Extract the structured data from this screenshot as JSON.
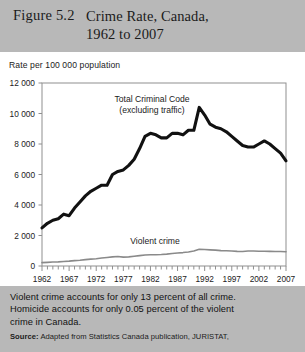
{
  "header": {
    "figure_number": "Figure 5.2",
    "title_line1": "Crime Rate, Canada,",
    "title_line2": "1962 to 2007"
  },
  "footer": {
    "note_line1": "Violent crime accounts for only 13 percent of all crime.",
    "note_line2": "Homicide accounts for only 0.05 percent of the violent",
    "note_line3": "crime in Canada.",
    "source_label": "Source:",
    "source_text": "Adapted from Statistics Canada publication, JURISTAT,"
  },
  "colors": {
    "header_band": "#b8b8b8",
    "footer_band": "#b8b8b8",
    "total_crime_line": "#111111",
    "violent_crime_line": "#8a8a8a",
    "axis": "#8f8f8f",
    "text": "#1b1b1b"
  },
  "chart_data": {
    "type": "line",
    "title": "Crime Rate, Canada, 1962 to 2007",
    "xlabel": "",
    "ylabel": "Rate per 100 000 population",
    "ylim": [
      0,
      12000
    ],
    "xlim": [
      1962,
      2007
    ],
    "grid": false,
    "legend_position": "inline-annotation",
    "ytick_labels": [
      "0",
      "2 000",
      "4 000",
      "6 000",
      "8 000",
      "10 000",
      "12 000"
    ],
    "ytick_values": [
      0,
      2000,
      4000,
      6000,
      8000,
      10000,
      12000
    ],
    "xtick_labels": [
      "1962",
      "1967",
      "1972",
      "1977",
      "1982",
      "1987",
      "1992",
      "1997",
      "2002",
      "2007"
    ],
    "xtick_values": [
      1962,
      1967,
      1972,
      1977,
      1982,
      1987,
      1992,
      1997,
      2002,
      2007
    ],
    "x": [
      1962,
      1963,
      1964,
      1965,
      1966,
      1967,
      1968,
      1969,
      1970,
      1971,
      1972,
      1973,
      1974,
      1975,
      1976,
      1977,
      1978,
      1979,
      1980,
      1981,
      1982,
      1983,
      1984,
      1985,
      1986,
      1987,
      1988,
      1989,
      1990,
      1991,
      1992,
      1993,
      1994,
      1995,
      1996,
      1997,
      1998,
      1999,
      2000,
      2001,
      2002,
      2003,
      2004,
      2005,
      2006,
      2007
    ],
    "series": [
      {
        "name": "Total Criminal Code (excluding traffic)",
        "annotation_line1": "Total Criminal Code",
        "annotation_line2": "(excluding traffic)",
        "color": "#111111",
        "values": [
          2500,
          2800,
          3000,
          3100,
          3400,
          3300,
          3800,
          4200,
          4600,
          4900,
          5100,
          5300,
          5300,
          6000,
          6200,
          6300,
          6600,
          7000,
          7700,
          8500,
          8700,
          8600,
          8400,
          8400,
          8700,
          8700,
          8600,
          8900,
          8900,
          10400,
          9900,
          9300,
          9100,
          9000,
          8800,
          8500,
          8200,
          7900,
          7800,
          7800,
          8000,
          8200,
          8000,
          7700,
          7400,
          6900
        ]
      },
      {
        "name": "Violent crime",
        "annotation_line1": "Violent crime",
        "color": "#8a8a8a",
        "values": [
          220,
          240,
          260,
          270,
          300,
          320,
          350,
          380,
          420,
          450,
          480,
          520,
          560,
          600,
          620,
          580,
          600,
          640,
          680,
          720,
          740,
          740,
          750,
          780,
          820,
          850,
          880,
          920,
          980,
          1100,
          1080,
          1060,
          1040,
          1010,
          1000,
          980,
          960,
          950,
          980,
          980,
          970,
          970,
          960,
          950,
          950,
          930
        ]
      }
    ]
  }
}
